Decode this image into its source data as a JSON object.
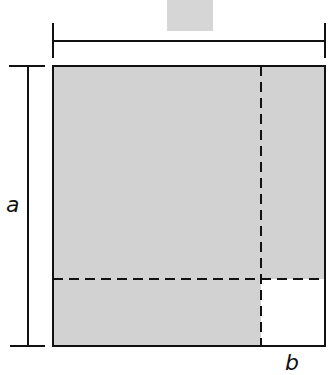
{
  "diagram": {
    "type": "geometry-square-decomposition",
    "labels": {
      "side_a": "a",
      "side_b": "b"
    },
    "colors": {
      "shaded_fill": "#d2d2d2",
      "unshaded_fill": "#ffffff",
      "stroke": "#111111"
    },
    "regions": [
      {
        "name": "large-square",
        "side": "a",
        "shaded": true
      },
      {
        "name": "right-strip",
        "shaded": true
      },
      {
        "name": "bottom-strip",
        "shaded": true
      },
      {
        "name": "corner-square",
        "side": "b",
        "shaded": false
      }
    ],
    "top_partial_block": {
      "shaded": true
    }
  }
}
